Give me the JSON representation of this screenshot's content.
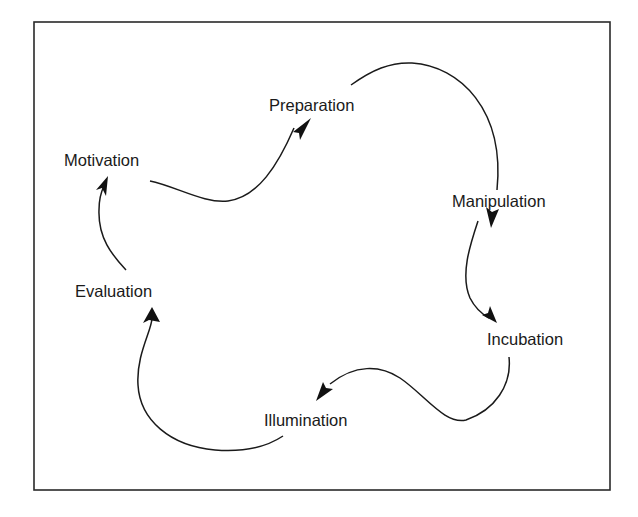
{
  "diagram": {
    "type": "cycle",
    "stages": [
      {
        "id": "motivation",
        "label": "Motivation"
      },
      {
        "id": "preparation",
        "label": "Preparation"
      },
      {
        "id": "manipulation",
        "label": "Manipulation"
      },
      {
        "id": "incubation",
        "label": "Incubation"
      },
      {
        "id": "illumination",
        "label": "Illumination"
      },
      {
        "id": "evaluation",
        "label": "Evaluation"
      }
    ],
    "edges": [
      {
        "from": "motivation",
        "to": "preparation"
      },
      {
        "from": "preparation",
        "to": "manipulation"
      },
      {
        "from": "manipulation",
        "to": "incubation"
      },
      {
        "from": "incubation",
        "to": "illumination"
      },
      {
        "from": "illumination",
        "to": "evaluation"
      },
      {
        "from": "evaluation",
        "to": "motivation"
      }
    ],
    "colors": {
      "line": "#1a1a1a",
      "text": "#1a1a1a",
      "background": "#ffffff"
    }
  }
}
